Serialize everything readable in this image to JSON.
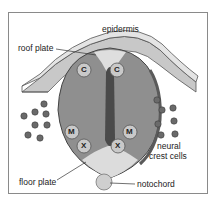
{
  "diagram": {
    "labels": {
      "epidermis": "epidermis",
      "roof_plate": "roof plate",
      "neural_crest_cells_line1": "neural",
      "neural_crest_cells_line2": "crest cells",
      "floor_plate": "floor plate",
      "notochord": "notochord"
    },
    "cell_markers": {
      "c_left": "C",
      "c_right": "C",
      "m_left": "M",
      "m_right": "M",
      "x_left": "X",
      "x_right": "X"
    },
    "colors": {
      "epidermis_top": "#e4e4e4",
      "epidermis_side": "#c8c8c8",
      "neural_tube": "#8f8f8f",
      "roof_plate": "#dedede",
      "floor_plate": "#dcdcdc",
      "lumen": "#4a4a4a",
      "crest_cells": "#6a6a6a",
      "notochord": "#cfcfcf",
      "marker_fill": "#c9c9c9"
    }
  }
}
